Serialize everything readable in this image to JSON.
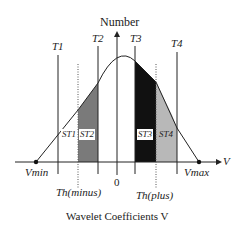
{
  "diagram": {
    "y_axis_label": "Number",
    "x_axis_title": "Wavelet Coefficients V",
    "x_axis_symbol": "V",
    "origin_label": "0",
    "v_min_label": "Vmin",
    "v_max_label": "Vmax",
    "thresholds": [
      {
        "label": "T1"
      },
      {
        "label": "T2"
      },
      {
        "label": "T3"
      },
      {
        "label": "T4"
      }
    ],
    "th_minus_label": "Th(minus)",
    "th_plus_label": "Th(plus)",
    "regions": [
      {
        "label": "ST1",
        "fill": "none"
      },
      {
        "label": "ST2",
        "fill": "#7a7a7a"
      },
      {
        "label": "ST3",
        "fill": "#111111"
      },
      {
        "label": "ST4",
        "fill": "#b8b8b8"
      }
    ]
  }
}
